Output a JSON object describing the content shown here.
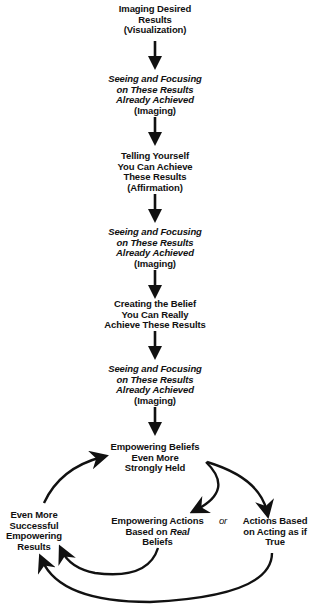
{
  "diagram": {
    "nodes": [
      {
        "id": "n1",
        "lines": [
          "Imaging Desired",
          "Results",
          "(Visualization)"
        ]
      },
      {
        "id": "n2",
        "lines": [
          "Seeing and Focusing",
          "on These Results",
          "Already Achieved",
          "(Imaging)"
        ]
      },
      {
        "id": "n3",
        "lines": [
          "Telling Yourself",
          "You Can Achieve",
          "These Results",
          "(Affirmation)"
        ]
      },
      {
        "id": "n4",
        "lines": [
          "Seeing and Focusing",
          "on These Results",
          "Already Achieved",
          "(Imaging)"
        ]
      },
      {
        "id": "n5",
        "lines": [
          "Creating the Belief",
          "You Can Really",
          "Achieve These Results"
        ]
      },
      {
        "id": "n6",
        "lines": [
          "Seeing and Focusing",
          "on These Results",
          "Already Achieved",
          "(Imaging)"
        ]
      },
      {
        "id": "n7",
        "lines": [
          "Empowering Beliefs",
          "Even More",
          "Strongly Held"
        ]
      },
      {
        "id": "n8",
        "lines": [
          "Empowering Actions",
          "Based on ",
          "Real",
          "Beliefs"
        ]
      },
      {
        "id": "n9",
        "lines": [
          "Actions Based",
          "on Acting as if",
          "True"
        ]
      },
      {
        "id": "n10",
        "lines": [
          "Even More",
          "Successful",
          "Empowering",
          "Results"
        ]
      }
    ],
    "connector_label": "or"
  }
}
